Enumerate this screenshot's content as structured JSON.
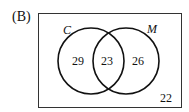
{
  "option_label": "(B)",
  "venn": {
    "sets": [
      {
        "name": "C",
        "only_count": "29"
      },
      {
        "name": "M",
        "only_count": "26"
      }
    ],
    "intersection": "23",
    "outside": "22"
  }
}
